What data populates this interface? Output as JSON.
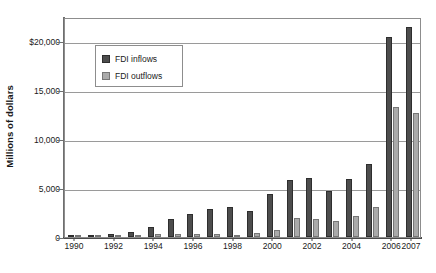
{
  "chart_data": {
    "type": "bar",
    "title": "",
    "subtitle": "",
    "xlabel": "",
    "ylabel": "Millions of dollars",
    "ylim": [
      0,
      22500
    ],
    "yticks": [
      0,
      5000,
      10000,
      15000,
      20000
    ],
    "ytick_labels": [
      "0",
      "5,000",
      "10,000",
      "15,000",
      "$20,000"
    ],
    "grid": true,
    "legend_position": "upper-left-inside",
    "categories": [
      "1990",
      "1991",
      "1992",
      "1993",
      "1994",
      "1995",
      "1996",
      "1997",
      "1998",
      "1999",
      "2000",
      "2001",
      "2002",
      "2003",
      "2004",
      "2005",
      "2006",
      "2007"
    ],
    "xtick_labels": [
      "1990",
      "1992",
      "1994",
      "1996",
      "1998",
      "2000",
      "2002",
      "2004",
      "2006",
      "2007"
    ],
    "series": [
      {
        "name": "FDI inflows",
        "color": "#4d4d4d",
        "values": [
          200,
          150,
          350,
          500,
          1050,
          1800,
          2350,
          2900,
          3100,
          2700,
          4400,
          5800,
          6000,
          4700,
          5900,
          7500,
          20500,
          21500
        ]
      },
      {
        "name": "FDI outflows",
        "color": "#aaaaaa",
        "values": [
          120,
          100,
          150,
          200,
          300,
          300,
          350,
          350,
          250,
          400,
          700,
          1900,
          1800,
          1650,
          2200,
          3100,
          13300,
          12700
        ]
      }
    ]
  },
  "legend": {
    "items": [
      {
        "label": "FDI inflows"
      },
      {
        "label": "FDI outflows"
      }
    ]
  }
}
